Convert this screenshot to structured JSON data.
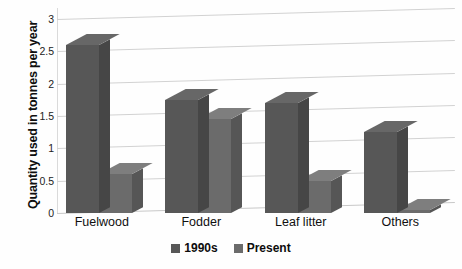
{
  "chart_data": {
    "type": "bar",
    "title": "",
    "subtitle": "",
    "xlabel": "",
    "ylabel": "Quantity used in tonnes per year",
    "categories": [
      "Fuelwood",
      "Fodder",
      "Leaf litter",
      "Others"
    ],
    "series": [
      {
        "name": "1990s",
        "values": [
          2.6,
          1.75,
          1.7,
          1.25
        ],
        "color": "#575757"
      },
      {
        "name": "Present",
        "values": [
          0.6,
          1.45,
          0.5,
          0.05
        ],
        "color": "#6b6b6b"
      }
    ],
    "ylim": [
      0,
      3
    ],
    "yticks": [
      "0",
      "0.5",
      "1",
      "1.5",
      "2",
      "2.5",
      "3"
    ],
    "ytick_values": [
      0,
      0.5,
      1,
      1.5,
      2,
      2.5,
      3
    ],
    "grid": true,
    "grid_color": "#d2d2d2",
    "legend_position": "bottom",
    "three_d": true,
    "background_color": "#ffffff"
  },
  "legend": {
    "entries": [
      {
        "label": "1990s",
        "color": "#575757"
      },
      {
        "label": "Present",
        "color": "#6b6b6b"
      }
    ]
  },
  "axis": {
    "y_title": "Quantity used in tonnes per year"
  }
}
